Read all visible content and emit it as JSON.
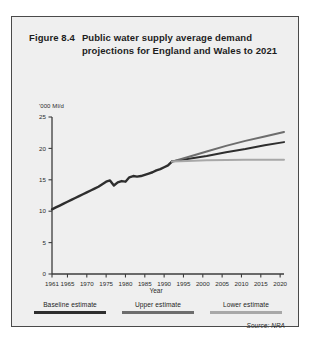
{
  "figure": {
    "number": "Figure 8.4",
    "title": "Public water supply average demand projections for England and Wales to 2021",
    "source": "Source: NRA"
  },
  "axes": {
    "y_unit": "'000 Ml/d",
    "x_title": "Year"
  },
  "legend": {
    "items": [
      {
        "label": "Baseline estimate",
        "color": "#2e2e2e"
      },
      {
        "label": "Upper estimate",
        "color": "#6d6d6d"
      },
      {
        "label": "Lower estimate",
        "color": "#a8a8a8"
      }
    ]
  },
  "chart_data": {
    "type": "line",
    "title": "Public water supply average demand projections for England and Wales to 2021",
    "xlabel": "Year",
    "ylabel": "'000 Ml/d",
    "xlim": [
      1961,
      2021
    ],
    "ylim": [
      0,
      25
    ],
    "yticks": [
      0,
      5,
      10,
      15,
      20,
      25
    ],
    "xticks": [
      1961,
      1965,
      1970,
      1975,
      1980,
      1985,
      1990,
      1995,
      2000,
      2005,
      2010,
      2015,
      2020
    ],
    "xtick_labels": [
      "1961",
      "1965",
      "1970",
      "1975",
      "1980",
      "1985",
      "1990",
      "1995",
      "2000",
      "2005",
      "2010",
      "2015",
      "2020"
    ],
    "grid": false,
    "legend_position": "bottom",
    "series": [
      {
        "name": "Historical",
        "color": "#2e2e2e",
        "width": 2.4,
        "x": [
          1961,
          1962,
          1963,
          1964,
          1965,
          1966,
          1967,
          1968,
          1969,
          1970,
          1971,
          1972,
          1973,
          1974,
          1975,
          1976,
          1977,
          1978,
          1979,
          1980,
          1981,
          1982,
          1983,
          1984,
          1985,
          1986,
          1987,
          1988,
          1989,
          1990,
          1991,
          1992
        ],
        "y": [
          10.3,
          10.6,
          10.9,
          11.2,
          11.5,
          11.8,
          12.1,
          12.4,
          12.7,
          13.0,
          13.3,
          13.6,
          13.9,
          14.3,
          14.7,
          14.9,
          14.1,
          14.6,
          14.8,
          14.7,
          15.4,
          15.6,
          15.5,
          15.6,
          15.8,
          16.0,
          16.2,
          16.5,
          16.7,
          17.0,
          17.3,
          17.9
        ]
      },
      {
        "name": "Baseline estimate",
        "color": "#2e2e2e",
        "width": 2.0,
        "x": [
          1992,
          1996,
          2001,
          2006,
          2011,
          2016,
          2021
        ],
        "y": [
          17.9,
          18.3,
          18.8,
          19.4,
          19.9,
          20.5,
          21.0
        ]
      },
      {
        "name": "Upper estimate",
        "color": "#6d6d6d",
        "width": 2.0,
        "x": [
          1992,
          1996,
          2001,
          2006,
          2011,
          2016,
          2021
        ],
        "y": [
          17.9,
          18.6,
          19.5,
          20.4,
          21.2,
          21.9,
          22.6
        ]
      },
      {
        "name": "Lower estimate",
        "color": "#a8a8a8",
        "width": 2.0,
        "x": [
          1992,
          1996,
          2001,
          2006,
          2011,
          2016,
          2021
        ],
        "y": [
          17.9,
          18.0,
          18.1,
          18.15,
          18.2,
          18.2,
          18.2
        ]
      }
    ]
  }
}
